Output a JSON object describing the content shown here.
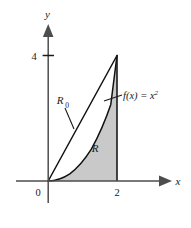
{
  "figure": {
    "title": "",
    "background_color": "#ffffff",
    "axes": {
      "x_axis_label": "x",
      "y_axis_label": "y",
      "origin_label": "0",
      "x_ticks": [
        {
          "value": 2,
          "label": "2"
        }
      ],
      "y_ticks": [
        {
          "value": 4,
          "label": "4"
        }
      ],
      "axis_color": "#4d4d4d",
      "x_range": [
        -0.45,
        2.55
      ],
      "y_range": [
        -0.55,
        4.9
      ]
    },
    "curve": {
      "name": "parabola",
      "label_text": "f(x) = x",
      "label_function_name": "f",
      "label_variable": "x",
      "label_exponent": "2",
      "expression": "x^2",
      "stroke_color": "#111111",
      "domain": [
        0,
        2
      ]
    },
    "chord": {
      "name": "secant-line",
      "from": [
        0,
        0
      ],
      "to": [
        2,
        4
      ],
      "stroke_color": "#111111"
    },
    "regions": [
      {
        "id": "R",
        "label": "R",
        "subscript": "",
        "description": "region under the parabola",
        "fill_color": "#c9c9c9",
        "label_position": [
          1.42,
          1.1
        ]
      },
      {
        "id": "R0",
        "label": "R",
        "subscript": "0",
        "description": "region between chord and parabola",
        "fill_color": "#ffffff",
        "label_position": [
          0.62,
          2.55
        ]
      }
    ],
    "leader_lines": [
      {
        "name": "r0-leader",
        "from": [
          0.72,
          2.28
        ],
        "to": [
          0.96,
          1.55
        ]
      },
      {
        "name": "fx-leader",
        "from": [
          1.93,
          2.92
        ],
        "to": [
          2.32,
          3.12
        ]
      }
    ]
  }
}
